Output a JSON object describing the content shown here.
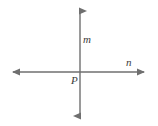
{
  "figure": {
    "type": "geometry-diagram",
    "canvas": {
      "width": 158,
      "height": 126,
      "background": "#ffffff"
    },
    "stroke_color": "#6f6f6f",
    "label_color": "#3b3b3b",
    "lines": [
      {
        "name": "vertical-line",
        "label": "m",
        "label_x": 83,
        "label_y": 43,
        "x1": 80,
        "y1": 6,
        "x2": 80,
        "y2": 121,
        "arrow_start": true,
        "arrow_end": true
      },
      {
        "name": "horizontal-line",
        "label": "n",
        "label_x": 126,
        "label_y": 66,
        "x1": 8,
        "y1": 72,
        "x2": 149,
        "y2": 72,
        "arrow_start": true,
        "arrow_end": true
      }
    ],
    "points": [
      {
        "name": "intersection-point",
        "label": "P",
        "x": 80,
        "y": 72,
        "label_x": 71,
        "label_y": 84
      }
    ]
  }
}
